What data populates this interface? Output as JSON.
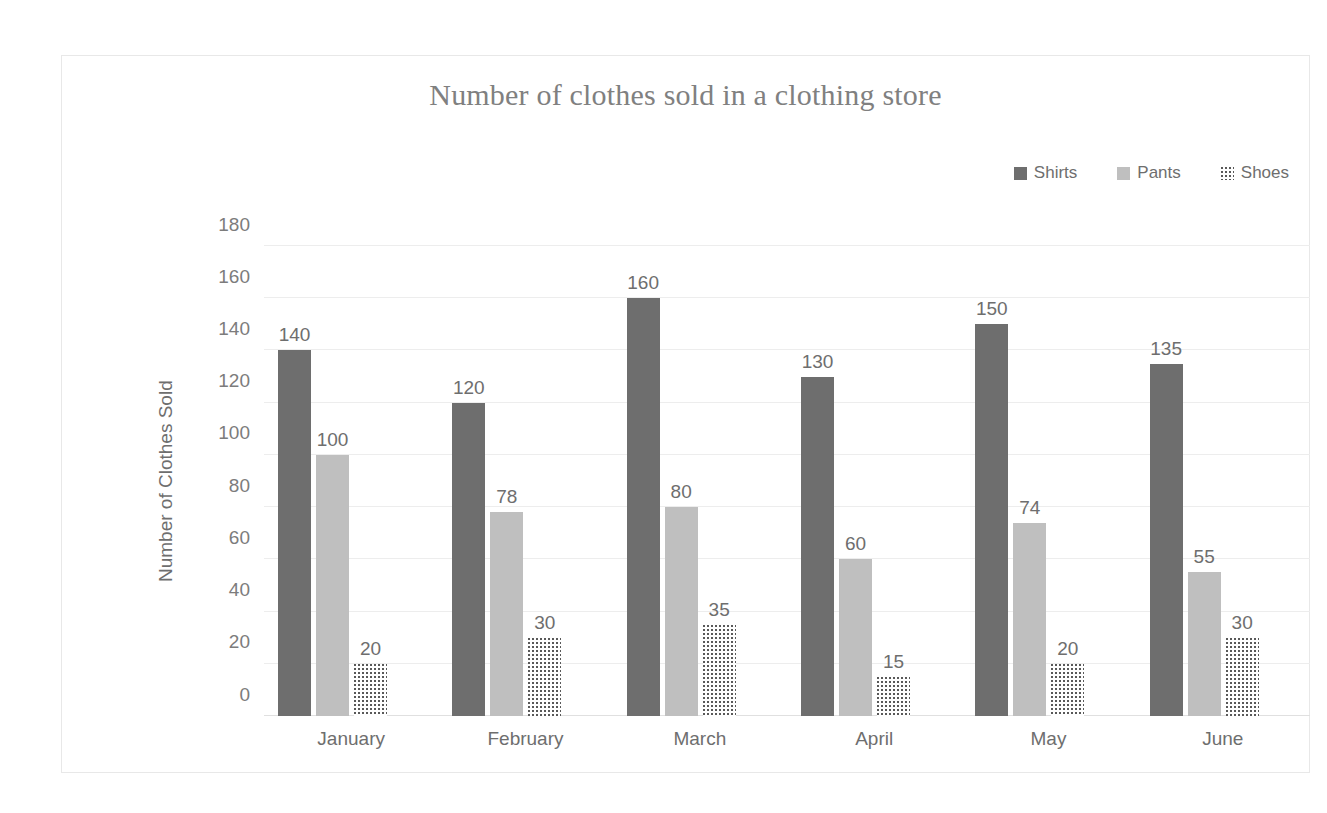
{
  "chart_data": {
    "type": "bar",
    "title": "Number of clothes sold in a clothing store",
    "xlabel": "",
    "ylabel": "Number of Clothes Sold",
    "categories": [
      "January",
      "February",
      "March",
      "April",
      "May",
      "June"
    ],
    "series": [
      {
        "name": "Shirts",
        "color": "#6e6e6e",
        "pattern": "solid",
        "values": [
          140,
          120,
          160,
          130,
          150,
          135
        ]
      },
      {
        "name": "Pants",
        "color": "#bfbfbf",
        "pattern": "solid",
        "values": [
          100,
          78,
          80,
          60,
          74,
          55
        ]
      },
      {
        "name": "Shoes",
        "color": "#595959",
        "pattern": "dotted",
        "values": [
          20,
          30,
          35,
          15,
          20,
          30
        ]
      }
    ],
    "ylim": [
      0,
      180
    ],
    "yticks": [
      0,
      20,
      40,
      60,
      80,
      100,
      120,
      140,
      160,
      180
    ],
    "ytick_labels": [
      "0",
      "20",
      "40",
      "60",
      "80",
      "100",
      "120",
      "140",
      "160",
      "180"
    ],
    "grid": true,
    "legend_position": "top-right",
    "data_labels": true
  },
  "legend": {
    "items": [
      {
        "label": "Shirts",
        "swatch": "legend-swatch-shirts"
      },
      {
        "label": "Pants",
        "swatch": "legend-swatch-pants"
      },
      {
        "label": "Shoes",
        "swatch": "legend-swatch-shoes"
      }
    ]
  }
}
